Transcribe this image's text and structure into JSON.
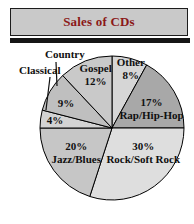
{
  "title_bar": {
    "title": "Sales of CDs",
    "bg_color": "#c9c9c9",
    "text_color": "#8b1818"
  },
  "chart_data": {
    "type": "pie",
    "title": "Sales of CDs",
    "unit": "%",
    "legend_position": "labels-on-slices",
    "layout": {
      "cx": 112,
      "cy": 128,
      "r": 72,
      "start_angle_deg": 0,
      "direction": "clockwise",
      "stroke": "#000000"
    },
    "slices": [
      {
        "id": "other",
        "name": "Other",
        "value": 8,
        "color": "#d6d6d6",
        "label_lines": [
          "Other",
          "8%"
        ],
        "label_angle_deg": 17.5,
        "label_r": 0.87
      },
      {
        "id": "rap-hip-hop",
        "name": "Rap/Hip-Hop",
        "value": 17,
        "color": "#a8a8a8",
        "label_lines": [
          "17%",
          "Rap/Hip-Hop"
        ],
        "label_angle_deg": 64,
        "label_r": 0.61
      },
      {
        "id": "rock-soft-rock",
        "name": "Rock/Soft Rock",
        "value": 30,
        "color": "#dedede",
        "label_lines": [
          "30%",
          "Rock/Soft Rock"
        ],
        "label_angle_deg": 128,
        "label_r": 0.55
      },
      {
        "id": "jazz-blues",
        "name": "Jazz/Blues",
        "value": 20,
        "color": "#c6c6c6",
        "label_lines": [
          "20%",
          "Jazz/Blues"
        ],
        "label_angle_deg": 236,
        "label_r": 0.6
      },
      {
        "id": "classical",
        "name": "Classical",
        "value": 4,
        "color": "#d3d3d3",
        "label_lines": [
          "4%"
        ],
        "label_angle_deg": 278,
        "label_r": 0.8
      },
      {
        "id": "country",
        "name": "Country",
        "value": 9,
        "color": "#bfbfbf",
        "label_lines": [
          "9%"
        ],
        "label_angle_deg": 299,
        "label_r": 0.73
      },
      {
        "id": "gospel",
        "name": "Gospel",
        "value": 12,
        "color": "#c9c9c9",
        "label_lines": [
          "Gospel",
          "12%"
        ],
        "label_angle_deg": 343,
        "label_r": 0.78
      }
    ],
    "outside_labels": [
      {
        "id": "country",
        "text": "Country"
      },
      {
        "id": "classical",
        "text": "Classical"
      }
    ]
  }
}
